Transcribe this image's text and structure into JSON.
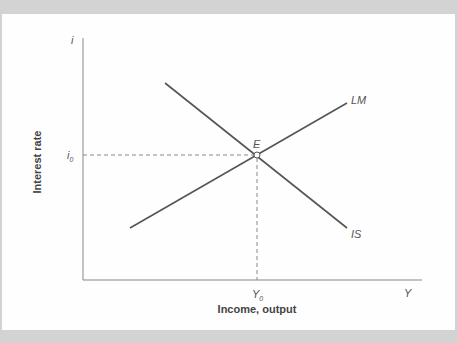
{
  "diagram": {
    "title": "",
    "y_axis": {
      "label": "Interest rate",
      "symbol": "i",
      "marker": "i",
      "marker_sub": "0"
    },
    "x_axis": {
      "label": "Income, output",
      "symbol": "Y",
      "marker": "Y",
      "marker_sub": "0"
    },
    "curves": [
      {
        "name": "IS",
        "label": "IS",
        "slope": "downward"
      },
      {
        "name": "LM",
        "label": "LM",
        "slope": "upward"
      }
    ],
    "equilibrium": {
      "label": "E"
    },
    "colors": {
      "line": "#555555",
      "axis": "#777777",
      "background": "#fefefe",
      "frame": "#d3d3d3"
    }
  }
}
